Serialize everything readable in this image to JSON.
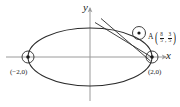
{
  "figure": {
    "type": "ellipse-with-secant-lines",
    "axes": {
      "x_label": "x",
      "y_label": "y",
      "origin_px": [
        90,
        57
      ]
    },
    "curve": {
      "name": "ellipse",
      "center": [
        0,
        0
      ],
      "semi_major_a": 2,
      "semi_minor_b": 1,
      "semi_major_px": 62,
      "semi_minor_px": 29,
      "stroke": "#2b2b2b"
    },
    "points": [
      {
        "id": "left-vertex",
        "label": "(−2,0)",
        "x": -2,
        "y": 0,
        "px": [
          28,
          57
        ],
        "marker": "circled-dot"
      },
      {
        "id": "right-vertex",
        "label": "(2,0)",
        "x": 2,
        "y": 0,
        "px": [
          152,
          57
        ],
        "marker": "circled-dot"
      },
      {
        "id": "point-a",
        "name": "A",
        "x_fraction": {
          "num": "8",
          "den": "5"
        },
        "y_fraction": {
          "num": "3",
          "den": "5"
        },
        "px": [
          139,
          33
        ],
        "marker": "circle"
      }
    ],
    "lines": [
      {
        "id": "secant-upper",
        "from_px": [
          96,
          22
        ],
        "to_px": [
          152,
          57
        ]
      },
      {
        "id": "secant-lower",
        "from_px": [
          101,
          19
        ],
        "to_px": [
          150,
          60
        ]
      }
    ],
    "colors": {
      "curve": "#2b2b2b",
      "axis": "#8c8c8c",
      "line": "#2b2b2b",
      "text": "#1a1a1a",
      "background": "#ffffff"
    }
  }
}
